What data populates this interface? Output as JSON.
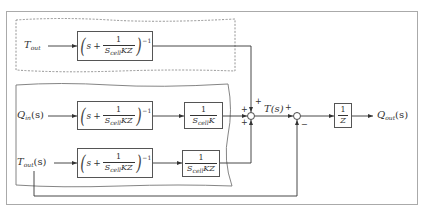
{
  "diagram": {
    "type": "block-diagram",
    "outer_frame": true,
    "regions": [
      {
        "id": "top-region",
        "style": "dashed"
      },
      {
        "id": "bottom-region",
        "style": "solid-wavy"
      }
    ],
    "inputs": {
      "t_out_top": {
        "main": "T",
        "sub": "out",
        "arg": ""
      },
      "q_in": {
        "main": "Q",
        "sub": "in",
        "arg": "(s)"
      },
      "t_out_bottom": {
        "main": "T",
        "sub": "out",
        "arg": "(s)"
      }
    },
    "blocks": {
      "tf_top": {
        "s": "s",
        "plus": "+",
        "num": "1",
        "den_main": "S",
        "den_sub": "cell",
        "den_rest": "KZ",
        "exp": "−1"
      },
      "tf_qin": {
        "s": "s",
        "plus": "+",
        "num": "1",
        "den_main": "S",
        "den_sub": "cell",
        "den_rest": "KZ",
        "exp": "−1"
      },
      "gain_qin": {
        "num": "1",
        "den_main": "S",
        "den_sub": "cell",
        "den_rest": "K"
      },
      "tf_tout": {
        "s": "s",
        "plus": "+",
        "num": "1",
        "den_main": "S",
        "den_sub": "cell",
        "den_rest": "KZ",
        "exp": "−1"
      },
      "gain_tout": {
        "num": "1",
        "den_main": "S",
        "den_sub": "cell",
        "den_rest": "KZ"
      },
      "inv_z": {
        "num": "1",
        "den": "Z"
      }
    },
    "summing_junctions": {
      "sum1": {
        "signs": {
          "top": "+",
          "left": "+",
          "bottom": "+"
        }
      },
      "sum2": {
        "signs": {
          "left": "+",
          "bottom": "−"
        }
      }
    },
    "signals": {
      "t_s": "T(s)",
      "output": {
        "main": "Q",
        "sub": "out",
        "arg": "(s)"
      }
    }
  }
}
